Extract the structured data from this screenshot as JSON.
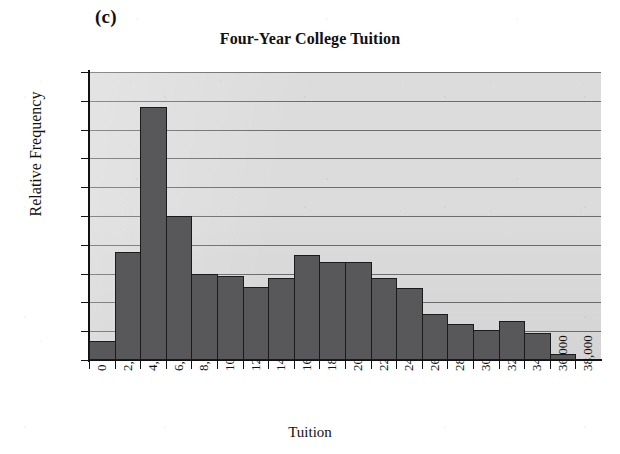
{
  "panel_label": "(c)",
  "axis": {
    "y_title": "Relative Frequency",
    "x_title": "Tuition",
    "y_ticks": [
      "0.2",
      "0.18",
      "0.16",
      "0.14",
      "0.12",
      "0.1",
      "0.08",
      "0.06",
      "0.04",
      "0.02",
      "0"
    ],
    "x_ticks": [
      "0",
      "2,000",
      "4,000",
      "6,000",
      "8,000",
      "10,000",
      "12,000",
      "14,000",
      "16,000",
      "18,000",
      "20,000",
      "22,000",
      "24,000",
      "26,000",
      "28,000",
      "30,000",
      "32,000",
      "34,000",
      "36,000",
      "38,000"
    ]
  },
  "colors": {
    "bar_fill": "#58585a",
    "bar_border": "#1b1b1b",
    "plot_background": "#dcdcdc",
    "gridline": "#6d6d6d",
    "axis": "#111111",
    "text": "#111111"
  },
  "chart_data": {
    "type": "bar",
    "title": "Four-Year College Tuition",
    "subtitle": "",
    "xlabel": "Tuition",
    "ylabel": "Relative Frequency",
    "xlim": [
      0,
      38000
    ],
    "ylim": [
      0,
      0.2
    ],
    "ytick_step": 0.02,
    "xtick_step": 2000,
    "grid": "horizontal",
    "legend": "none",
    "bin_width": 2000,
    "bin_edges": [
      0,
      2000,
      4000,
      6000,
      8000,
      10000,
      12000,
      14000,
      16000,
      18000,
      20000,
      22000,
      24000,
      26000,
      28000,
      30000,
      32000,
      34000,
      36000,
      38000
    ],
    "categories": [
      "0-2,000",
      "2,000-4,000",
      "4,000-6,000",
      "6,000-8,000",
      "8,000-10,000",
      "10,000-12,000",
      "12,000-14,000",
      "14,000-16,000",
      "16,000-18,000",
      "18,000-20,000",
      "20,000-22,000",
      "22,000-24,000",
      "24,000-26,000",
      "26,000-28,000",
      "28,000-30,000",
      "30,000-32,000",
      "32,000-34,000",
      "34,000-36,000",
      "36,000-38,000"
    ],
    "values": [
      0.013,
      0.075,
      0.176,
      0.1,
      0.06,
      0.058,
      0.051,
      0.057,
      0.073,
      0.068,
      0.068,
      0.057,
      0.05,
      0.032,
      0.025,
      0.021,
      0.027,
      0.019,
      0.004
    ]
  }
}
